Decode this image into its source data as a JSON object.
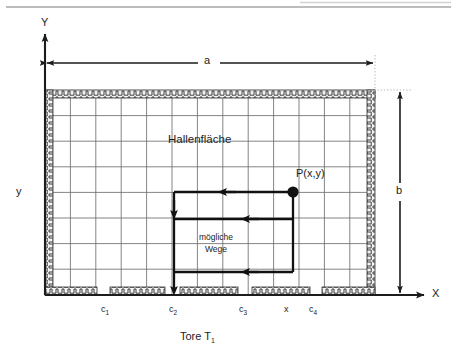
{
  "figure": {
    "kind": "technical-diagram",
    "description_labels": {
      "axis_y": "Y",
      "axis_x": "X",
      "axis_y_lower": "y",
      "dim_width": "a",
      "dim_height": "b",
      "area": "Hallenfläche",
      "point": "P(x,y)",
      "paths_line1": "mögliche",
      "paths_line2": "Wege",
      "caption_main": "Tore T",
      "caption_sub": "1"
    },
    "axis_ticks": [
      {
        "label": "c",
        "sub": "1",
        "x": 105
      },
      {
        "label": "c",
        "sub": "2",
        "x": 173
      },
      {
        "label": "c",
        "sub": "3",
        "x": 243
      },
      {
        "label": "x",
        "sub": "",
        "x": 288
      },
      {
        "label": "c",
        "sub": "4",
        "x": 313
      }
    ],
    "colors": {
      "ink": "#1c1c1c",
      "grid": "#6e6e6e",
      "wall_fill": "#f2f2f2",
      "rule": "#7a7a7a",
      "path": "#111111"
    },
    "geometry": {
      "hall_left": 45,
      "hall_right": 375,
      "hall_top": 90,
      "hall_bottom": 295,
      "grid_step_x": 25.4,
      "grid_step_y": 25.6,
      "point_px": 293,
      "point_py": 192,
      "path_rows": [
        192,
        219,
        272
      ],
      "path_vertical_x": 174,
      "path_exit_y": 300
    }
  }
}
